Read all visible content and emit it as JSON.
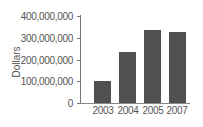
{
  "chart_data": {
    "type": "bar",
    "title": "",
    "xlabel": "",
    "ylabel": "Dollars",
    "categories": [
      "2003",
      "2004",
      "2005",
      "2007"
    ],
    "values": [
      102000000,
      235000000,
      334000000,
      327000000
    ],
    "ylim": [
      0,
      400000000
    ],
    "yticks": [
      "0",
      "100,000,000",
      "200,000,000",
      "300,000,000",
      "400,000,000"
    ],
    "grid": false,
    "legend": null,
    "bar_color": "#505050"
  }
}
